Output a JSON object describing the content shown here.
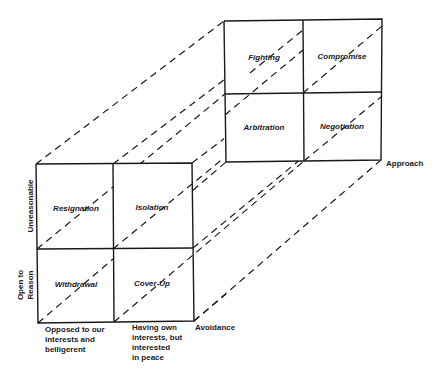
{
  "diagram": {
    "type": "3d-cube-matrix",
    "back_face": {
      "cells": [
        {
          "label": "Fighting",
          "row": 0,
          "col": 0
        },
        {
          "label": "Compromise",
          "row": 0,
          "col": 1
        },
        {
          "label": "Arbitration",
          "row": 1,
          "col": 0
        },
        {
          "label": "Negotiation",
          "row": 1,
          "col": 1
        }
      ],
      "depth_label": "Approach"
    },
    "front_face": {
      "cells": [
        {
          "label": "Resignation",
          "row": 0,
          "col": 0
        },
        {
          "label": "Isolation",
          "row": 0,
          "col": 1
        },
        {
          "label": "Withdrawal",
          "row": 1,
          "col": 0
        },
        {
          "label": "Cover-Up",
          "row": 1,
          "col": 1
        }
      ],
      "depth_label": "Avoidance"
    },
    "y_axis": {
      "top": "Unreasonable",
      "bottom_line1": "Open to",
      "bottom_line2": "Reason"
    },
    "x_axis": {
      "left_lines": [
        "Opposed to our",
        "interests  and",
        "belligerent"
      ],
      "right_lines": [
        "Having own",
        "interests, but",
        "interested",
        "in peace"
      ]
    }
  }
}
